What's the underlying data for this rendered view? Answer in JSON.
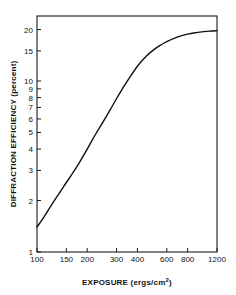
{
  "chart_data": {
    "type": "line",
    "title": "",
    "xlabel": "EXPOSURE (ergs/cm2)",
    "xlabel_main": "EXPOSURE (ergs/cm",
    "xlabel_sup": "2",
    "xlabel_tail": ")",
    "ylabel": "DIFFRACTION EFFICIENCY (percent)",
    "xscale": "log",
    "yscale": "log",
    "xlim": [
      100,
      1200
    ],
    "ylim": [
      1,
      24
    ],
    "grid": false,
    "legend": null,
    "xticks": [
      100,
      150,
      200,
      300,
      400,
      600,
      800,
      1200
    ],
    "xticklabels": [
      "100",
      "150",
      "200",
      "300",
      "400",
      "600",
      "800",
      "1200"
    ],
    "yticks": [
      1,
      2,
      3,
      4,
      5,
      6,
      7,
      8,
      9,
      10,
      15,
      20
    ],
    "yticklabels": [
      "1",
      "2",
      "3",
      "4",
      "5",
      "6",
      "7",
      "8",
      "9",
      "10",
      "15",
      "20"
    ],
    "series": [
      {
        "name": "diffraction efficiency",
        "x": [
          100,
          110,
          125,
          140,
          150,
          160,
          175,
          200,
          225,
          250,
          275,
          300,
          325,
          350,
          400,
          450,
          500,
          550,
          600,
          700,
          800,
          900,
          1000,
          1100,
          1200
        ],
        "y": [
          1.4,
          1.6,
          1.95,
          2.3,
          2.55,
          2.8,
          3.2,
          4.0,
          4.9,
          5.8,
          6.8,
          7.9,
          9.0,
          10.1,
          12.2,
          13.9,
          15.2,
          16.2,
          17.0,
          18.1,
          18.8,
          19.2,
          19.45,
          19.6,
          19.7
        ]
      }
    ]
  }
}
